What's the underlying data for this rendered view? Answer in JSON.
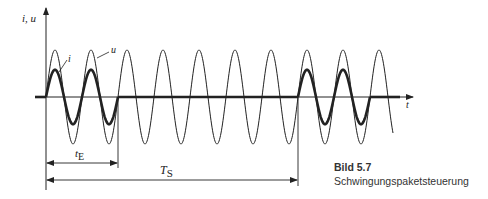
{
  "figure": {
    "number_label": "Bild 5.7",
    "caption": "Schwingungspaketsteuerung"
  },
  "axes": {
    "y_label": "i, u",
    "x_label": "t"
  },
  "curves": {
    "voltage_label": "u",
    "current_label": "i"
  },
  "dimensions": {
    "on_time_label": "t",
    "on_time_sub": "E",
    "period_label": "T",
    "period_sub": "S"
  },
  "chart_data": {
    "type": "line",
    "title": "Schwingungspaketsteuerung",
    "xlabel": "t",
    "ylabel": "i, u",
    "series": [
      {
        "name": "u",
        "description": "continuous sinusoidal supply voltage",
        "periods_shown": 9.5,
        "amplitude_rel": 1.0
      },
      {
        "name": "i",
        "description": "current bursts (packets) of 2 full periods, then 5 periods off",
        "amplitude_rel": 0.58,
        "on_periods": 2,
        "off_periods": 5
      }
    ],
    "annotations": [
      "t_E = 2 periods (on time)",
      "T_S = 7 periods (control period)"
    ]
  }
}
